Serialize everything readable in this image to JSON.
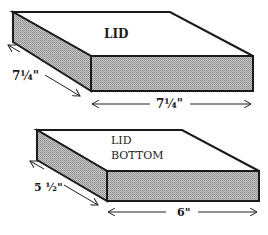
{
  "diagram": {
    "boxes": [
      {
        "name": "lid",
        "label_lines": [
          "LID"
        ],
        "depth_dimension": "7¼\"",
        "width_dimension": "7¼\""
      },
      {
        "name": "lid-bottom",
        "label_lines": [
          "LID",
          "BOTTOM"
        ],
        "depth_dimension": "5 ½\"",
        "width_dimension": "6\""
      }
    ]
  }
}
